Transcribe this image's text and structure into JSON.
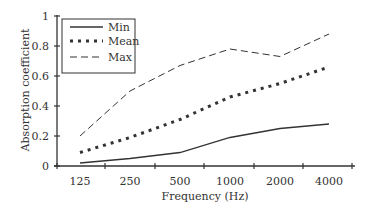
{
  "chart_data": {
    "type": "line",
    "title": "",
    "xlabel": "Frequency (Hz)",
    "ylabel": "Absorption coefficient",
    "categories": [
      "125",
      "250",
      "500",
      "1000",
      "2000",
      "4000"
    ],
    "yticks": [
      "0",
      "0.2",
      "0.4",
      "0.6",
      "0.8",
      "1"
    ],
    "ylim": [
      0,
      1
    ],
    "grid": false,
    "legend_position": "top-left",
    "series": [
      {
        "name": "Min",
        "style": "solid",
        "values": [
          0.02,
          0.05,
          0.09,
          0.19,
          0.25,
          0.28
        ]
      },
      {
        "name": "Mean",
        "style": "dotted-thick",
        "values": [
          0.09,
          0.19,
          0.31,
          0.46,
          0.55,
          0.66
        ]
      },
      {
        "name": "Max",
        "style": "dashed",
        "values": [
          0.2,
          0.5,
          0.67,
          0.78,
          0.73,
          0.88
        ]
      }
    ]
  }
}
